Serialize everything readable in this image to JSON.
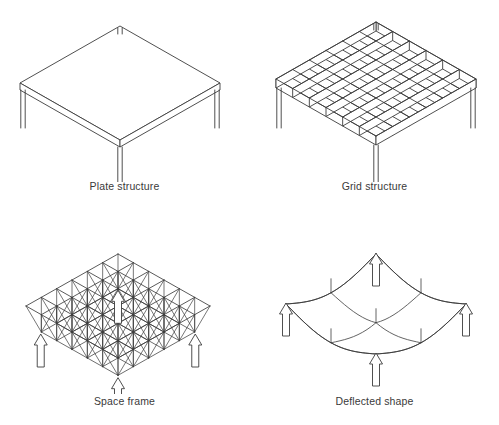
{
  "figure": {
    "background_color": "#ffffff",
    "line_color": "#3c3c3c",
    "caption_color": "#3a3a3a",
    "panel_count": 4
  },
  "panels": [
    {
      "id": "plate-structure",
      "caption": "Plate structure",
      "kind": "isometric-solid-slab",
      "description": "Flat solid plate slab shown in isometric view with visible edge thickness, supported on four slender columns",
      "grid_divisions": 0,
      "support_count": 4,
      "support_symbol": "column-line",
      "slab_thickness_px": 7
    },
    {
      "id": "grid-structure",
      "caption": "Grid structure",
      "kind": "isometric-waffle-grid",
      "description": "Two-way beam grid (waffle slab) shown in isometric view with orthogonal ribs of visible depth, supported on four columns",
      "grid_divisions": 6,
      "support_count": 4,
      "support_symbol": "column-line",
      "rib_depth_px": 9
    },
    {
      "id": "space-frame",
      "caption": "Space frame",
      "kind": "isometric-double-layer-truss",
      "description": "Double layer space frame with top chord grid, diagonal web members and offset bottom chord layer, supported at mid-edge points",
      "grid_divisions": 6,
      "support_count": 4,
      "support_symbol": "reaction-arrow",
      "layer_offset_px": 26
    },
    {
      "id": "deflected-shape",
      "caption": "Deflected shape",
      "kind": "isometric-deflected-surface",
      "description": "Deflected shape of a two-way spanning slab supported at four mid-edge points, edges sagging downward in curves",
      "grid_divisions": 2,
      "support_count": 4,
      "support_symbol": "reaction-arrow",
      "max_sag_px": 34
    }
  ],
  "geometry": {
    "plate": {
      "center_x": 120,
      "apex_y": 26,
      "half_width": 100,
      "half_depth": 57,
      "thickness": 7,
      "leg_length": 38,
      "leg_half_width": 2.2
    },
    "grid": {
      "center_x": 126,
      "apex_y": 22,
      "half_width": 100,
      "half_depth": 57,
      "rib_depth": 9,
      "divisions": 6,
      "leg_length": 40,
      "leg_half_width": 2.2
    },
    "spaceframe": {
      "center_x": 118,
      "apex_y": 42,
      "half_width": 92,
      "half_depth": 52,
      "divisions": 6,
      "layer_drop": 26,
      "support_stem_h": 22,
      "support_stem_w": 7,
      "support_head_w": 13,
      "support_head_h": 11
    },
    "deflected": {
      "center_x": 126,
      "apex_y": 42,
      "half_width": 90,
      "half_depth": 50,
      "divisions": 2,
      "sag": 34,
      "node_drop": 14,
      "support_stem_h": 22,
      "support_stem_w": 7,
      "support_head_w": 13,
      "support_head_h": 11
    }
  }
}
